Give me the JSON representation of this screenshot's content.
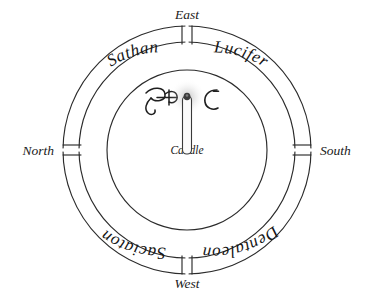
{
  "diagram": {
    "background_color": "#ffffff",
    "line_color": "#2b2b2b",
    "text_color": "#1a1a1a",
    "center": {
      "x": 187,
      "y": 150
    },
    "radii": {
      "outer": 124,
      "middle": 108,
      "inner": 80
    }
  },
  "cardinals": {
    "east": {
      "label": "East",
      "position": "top"
    },
    "north": {
      "label": "North",
      "position": "left"
    },
    "south": {
      "label": "South",
      "position": "right"
    },
    "west": {
      "label": "West",
      "position": "bottom"
    }
  },
  "ring_names": {
    "upper_left": {
      "label": "Sathan",
      "orientation": "upright",
      "quadrant": "north-east"
    },
    "upper_right": {
      "label": "Lucifer",
      "orientation": "upright",
      "quadrant": "east-south"
    },
    "lower_right": {
      "label": "Dentaleon",
      "orientation": "inverted",
      "quadrant": "south-west"
    },
    "lower_left": {
      "label": "Saciaton",
      "orientation": "inverted",
      "quadrant": "west-north"
    }
  },
  "center": {
    "candle_label": "Candle",
    "sigil_left": {
      "name": "sigil-left",
      "glyph": "φ̵"
    },
    "sigil_right": {
      "name": "sigil-right",
      "glyph": "Ɔ"
    }
  },
  "gates": [
    {
      "name": "gate-east",
      "angle_deg": 270
    },
    {
      "name": "gate-south",
      "angle_deg": 0
    },
    {
      "name": "gate-west",
      "angle_deg": 90
    },
    {
      "name": "gate-north",
      "angle_deg": 180
    }
  ]
}
